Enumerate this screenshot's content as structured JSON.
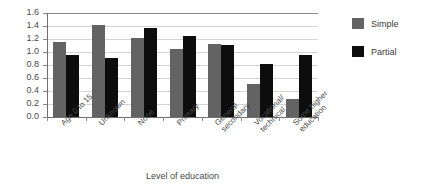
{
  "chart_data": {
    "type": "bar",
    "title": "",
    "xlabel": "Level of education",
    "ylabel": "",
    "ylim": [
      0.0,
      1.6
    ],
    "yticks": [
      "0.0",
      "0.2",
      "0.4",
      "0.6",
      "0.8",
      "1.0",
      "1.2",
      "1.4",
      "1.6"
    ],
    "ytick_values": [
      0.0,
      0.2,
      0.4,
      0.6,
      0.8,
      1.0,
      1.2,
      1.4,
      1.6
    ],
    "grid": true,
    "legend_position": "right",
    "categories": [
      "Age 0 to 15",
      "Unknown",
      "None",
      "Primary",
      "General\nsecondary",
      "Vocational/\ntechnical",
      "Some higher\neducation"
    ],
    "series": [
      {
        "name": "Simple",
        "color": "#636363",
        "values": [
          1.16,
          1.42,
          1.22,
          1.05,
          1.12,
          0.51,
          0.27
        ]
      },
      {
        "name": "Partial",
        "color": "#0d0d0d",
        "values": [
          0.95,
          0.91,
          1.37,
          1.24,
          1.11,
          0.81,
          0.96
        ]
      }
    ]
  },
  "legend": {
    "items": [
      {
        "label": "Simple",
        "color": "#636363"
      },
      {
        "label": "Partial",
        "color": "#0d0d0d"
      }
    ]
  }
}
